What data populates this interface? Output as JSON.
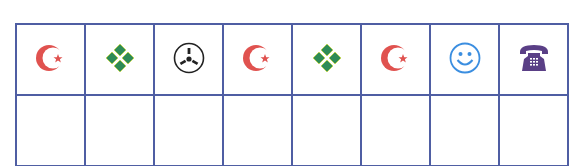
{
  "grid": {
    "rows": 2,
    "columns": 8,
    "line_color": "#4f5ea3",
    "top_row": [
      {
        "icon": "crescent-star-icon",
        "color": "#e0524f"
      },
      {
        "icon": "four-diamonds-icon",
        "color": "#2e8b57"
      },
      {
        "icon": "radioactive-circle-icon",
        "color": "#222222"
      },
      {
        "icon": "crescent-star-icon",
        "color": "#e0524f"
      },
      {
        "icon": "four-diamonds-icon",
        "color": "#2e8b57"
      },
      {
        "icon": "crescent-star-icon",
        "color": "#e0524f"
      },
      {
        "icon": "smiley-face-icon",
        "color": "#3b8ee0"
      },
      {
        "icon": "telephone-icon",
        "color": "#5a3f86"
      }
    ],
    "bottom_row": [
      "",
      "",
      "",
      "",
      "",
      "",
      "",
      ""
    ]
  }
}
